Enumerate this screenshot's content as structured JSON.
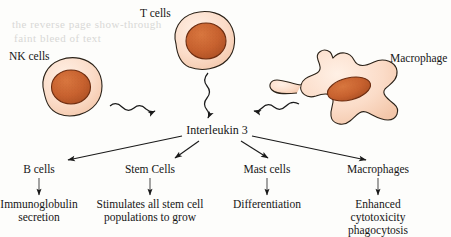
{
  "diagram": {
    "central_node": "Interleukin 3",
    "colors": {
      "cytoplasm": "#FBDCC8",
      "cytoplasm_edge": "#F6CBB0",
      "nucleus": "#C8622F",
      "nucleus_dark": "#A8481F",
      "outline": "#2b2218",
      "text": "#161616",
      "background": "#fdfdfb",
      "ghost_text": "#d8d8d6"
    },
    "sources": [
      {
        "id": "nk-cell",
        "label": "NK cells",
        "shape": "round-cell",
        "arrow": "wavy",
        "arrow_direction": "down-right"
      },
      {
        "id": "t-cell",
        "label": "T cells",
        "shape": "round-cell",
        "arrow": "wavy",
        "arrow_direction": "down"
      },
      {
        "id": "macrophage-source",
        "label": "Macrophage",
        "shape": "amoeboid-cell",
        "arrow": "wavy",
        "arrow_direction": "down-left"
      }
    ],
    "targets": [
      {
        "id": "b-cells",
        "label": "B cells",
        "effect": "Immunoglobulin\nsecretion",
        "effect_lines": [
          "Immunoglobulin",
          "secretion"
        ]
      },
      {
        "id": "stem-cells",
        "label": "Stem Cells",
        "effect": "Stimulates all stem cell\npopulations to grow",
        "effect_lines": [
          "Stimulates all stem cell",
          "populations to grow"
        ]
      },
      {
        "id": "mast-cells",
        "label": "Mast cells",
        "effect": "Differentiation",
        "effect_lines": [
          "Differentiation"
        ]
      },
      {
        "id": "macrophages",
        "label": "Macrophages",
        "effect": "Enhanced\ncytotoxicity\nphagocytosis",
        "effect_lines": [
          "Enhanced",
          "cytotoxicity",
          "phagocytosis"
        ]
      }
    ],
    "ghost_text": {
      "line1": "the reverse page show-through",
      "line2": "faint bleed of text"
    }
  }
}
